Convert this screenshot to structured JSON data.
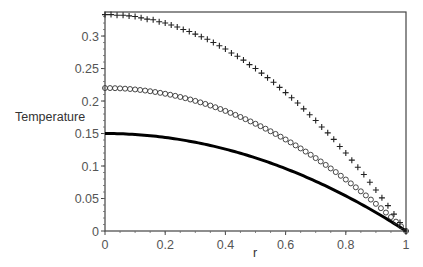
{
  "chart_data": {
    "type": "line",
    "title": "",
    "xlabel": "r",
    "ylabel": "Temperature",
    "xlim": [
      0,
      1
    ],
    "ylim": [
      0,
      0.337
    ],
    "grid": false,
    "legend": null,
    "x_ticks": [
      0,
      0.2,
      0.4,
      0.6,
      0.8,
      1
    ],
    "x_tick_labels": [
      "0",
      "0.2",
      "0.4",
      "0.6",
      "0.8",
      "1"
    ],
    "y_ticks": [
      0,
      0.05,
      0.1,
      0.15,
      0.2,
      0.25,
      0.3
    ],
    "y_tick_labels": [
      "0",
      "0.05",
      "0.1",
      "0.15",
      "0.2",
      "0.25",
      "0.3"
    ],
    "series": [
      {
        "name": "plus-markers",
        "style": "marker",
        "marker": "+",
        "color": "#222222",
        "formula": "T = 0.333*(1 - r^2)",
        "x": [
          0,
          0.02,
          0.04,
          0.06,
          0.08,
          0.1,
          0.12,
          0.14,
          0.16,
          0.18,
          0.2,
          0.22,
          0.24,
          0.26,
          0.28,
          0.3,
          0.32,
          0.34,
          0.36,
          0.38,
          0.4,
          0.42,
          0.44,
          0.46,
          0.48,
          0.5,
          0.52,
          0.54,
          0.56,
          0.58,
          0.6,
          0.62,
          0.64,
          0.66,
          0.68,
          0.7,
          0.72,
          0.74,
          0.76,
          0.78,
          0.8,
          0.82,
          0.84,
          0.86,
          0.88,
          0.9,
          0.92,
          0.94,
          0.96,
          0.98,
          1
        ],
        "values": [
          0.333,
          0.333,
          0.332,
          0.332,
          0.331,
          0.33,
          0.328,
          0.326,
          0.325,
          0.322,
          0.32,
          0.317,
          0.314,
          0.31,
          0.307,
          0.303,
          0.299,
          0.295,
          0.29,
          0.285,
          0.28,
          0.274,
          0.269,
          0.263,
          0.256,
          0.25,
          0.243,
          0.236,
          0.229,
          0.221,
          0.213,
          0.205,
          0.197,
          0.188,
          0.179,
          0.17,
          0.16,
          0.151,
          0.141,
          0.13,
          0.12,
          0.109,
          0.098,
          0.087,
          0.075,
          0.063,
          0.051,
          0.039,
          0.026,
          0.013,
          0
        ]
      },
      {
        "name": "circle-markers",
        "style": "marker",
        "marker": "o",
        "color": "#333333",
        "formula": "T = 0.22*(1 - r^2)",
        "x_step": 0.016667,
        "x_range": [
          0,
          1
        ],
        "values_sample": {
          "0": 0.22,
          "0.2": 0.211,
          "0.4": 0.185,
          "0.6": 0.141,
          "0.8": 0.079,
          "1": 0
        }
      },
      {
        "name": "solid-line",
        "style": "line",
        "color": "#000000",
        "formula": "T = 0.15*(1 - r^2)",
        "x": [
          0,
          0.1,
          0.2,
          0.3,
          0.4,
          0.5,
          0.6,
          0.7,
          0.8,
          0.9,
          1
        ],
        "values": [
          0.15,
          0.1485,
          0.144,
          0.1365,
          0.126,
          0.1125,
          0.096,
          0.0765,
          0.054,
          0.0285,
          0
        ]
      }
    ]
  },
  "layout": {
    "plot_left": 105,
    "plot_right": 406,
    "plot_top": 12,
    "plot_bottom": 231
  }
}
